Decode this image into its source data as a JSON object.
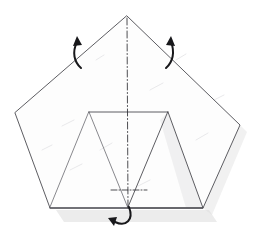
{
  "figure": {
    "caption": "Pentagon sheet with two upper flaps folded out and lower edge folded back",
    "background_color": "#ffffff",
    "paper_fill": "#fdfdfd",
    "edge_color": "#4b4b50",
    "fold_line_color": "#2e2e33",
    "arrow_color": "#18181b",
    "shadow_color": "#d9d9d9"
  },
  "canvas": {
    "width": 257,
    "height": 235
  },
  "geometry": {
    "pentagon_outline": {
      "name": "pentagon-sheet",
      "points": "127,16 240,125 203,208 50,208 15,113"
    },
    "left_upper_flap": {
      "name": "left-upper-flap",
      "points": "127,16 15,113 50,208 89,112"
    },
    "right_upper_flap": {
      "name": "right-upper-flap",
      "points": "127,16 168,112 203,208 240,125"
    },
    "inner_panel": {
      "name": "inner-center-panel",
      "points": "89,112 168,112 203,208 50,208"
    },
    "left_inner_triangle": {
      "name": "left-inner-triangle",
      "points": "89,112 128,208 50,208"
    },
    "right_inner_triangle": {
      "name": "right-inner-triangle",
      "points": "168,112 203,208 128,208"
    },
    "inner_top_edge": {
      "name": "inner-top-edge",
      "from": "89,112",
      "to": "168,112"
    },
    "bottom_edge": {
      "name": "bottom-edge",
      "from": "50,208",
      "to": "203,208"
    },
    "center_apex": "127,16",
    "center_base": "128,208"
  },
  "fold_lines": {
    "vertical_center": {
      "name": "vertical-center-fold-line",
      "label": "mountain-valley axis",
      "style": "dash-dot",
      "from": "127,18",
      "to": "128,208"
    },
    "bottom_horizontal": {
      "name": "bottom-horizontal-fold-line",
      "label": "fold back edge",
      "style": "dash-dot",
      "from": "112,190",
      "to": "146,190"
    }
  },
  "arrows": [
    {
      "id": "left-fold-arrow",
      "name": "left-fold-arrow",
      "direction": "up-left",
      "meaning": "fold left flap upward",
      "path": "M 81,68 C 74,62 72,52 77,42",
      "head_points": "77,36 73,46 82,45"
    },
    {
      "id": "right-fold-arrow",
      "name": "right-fold-arrow",
      "direction": "up-right",
      "meaning": "fold right flap upward",
      "path": "M 166,68 C 173,62 175,52 171,42",
      "head_points": "171,36 166,45 175,46"
    },
    {
      "id": "bottom-fold-arrow",
      "name": "bottom-fold-arrow",
      "direction": "left-under",
      "meaning": "fold bottom edge behind",
      "path": "M 129,207 C 134,220 126,227 115,222",
      "head_points": "108,218 117,217 114,226"
    }
  ],
  "shadows": [
    {
      "name": "bottom-drop-shadow",
      "points": "56,210 209,210 217,222 64,222",
      "opacity": 0.5
    },
    {
      "name": "right-drop-shadow",
      "points": "203,208 240,125 247,132 212,215",
      "opacity": 0.38
    },
    {
      "name": "right-inner-flap-shadow",
      "points": "168,112 203,208 186,208 160,120",
      "opacity": 0.3
    }
  ],
  "texture_streaks": [
    "M 62,126 L 74,120",
    "M 150,90 L 163,83",
    "M 196,140 L 208,133",
    "M 100,150 L 112,143",
    "M 70,170 L 82,164",
    "M 176,60 L 186,54",
    "M 42,150 L 52,145",
    "M 138,186 L 150,180",
    "M 214,100 L 224,95",
    "M 96,60 L 104,55"
  ]
}
